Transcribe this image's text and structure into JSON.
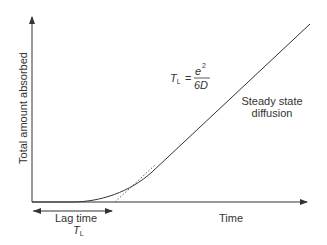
{
  "diagram": {
    "type": "line",
    "title": "",
    "y_axis_label": "Total amount absorbed",
    "x_axis_label": "Time",
    "lag_label": "Lag time",
    "lag_symbol": "T",
    "lag_symbol_sub": "L",
    "formula": {
      "lhs": "T",
      "lhs_sub": "L",
      "equals": "=",
      "numerator": "e",
      "numerator_sup": "2",
      "denominator": "6D"
    },
    "annotation_line1": "Steady state",
    "annotation_line2": "diffusion",
    "colors": {
      "line": "#333333",
      "text": "#333333",
      "background": "#ffffff"
    }
  }
}
